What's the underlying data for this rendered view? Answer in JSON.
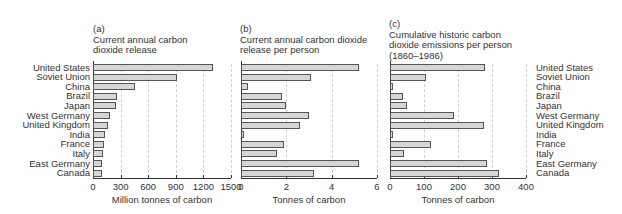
{
  "chart_data": [
    {
      "type": "bar",
      "orientation": "horizontal",
      "panel": "(a)",
      "title": "Current annual carbon dioxide release",
      "categories": [
        "United States",
        "Soviet Union",
        "China",
        "Brazil",
        "Japan",
        "West Germany",
        "United Kingdom",
        "India",
        "France",
        "Italy",
        "East Germany",
        "Canada"
      ],
      "values": [
        1300,
        915,
        460,
        260,
        255,
        190,
        165,
        130,
        120,
        110,
        95,
        100
      ],
      "xlabel": "Million tonnes of carbon",
      "xlim": [
        0,
        1500
      ],
      "ticks": [
        "0",
        "300",
        "600",
        "900",
        "1200",
        "1500"
      ],
      "grid": true
    },
    {
      "type": "bar",
      "orientation": "horizontal",
      "panel": "(b)",
      "title": "Current annual carbon dioxide release per person",
      "categories": [
        "United States",
        "Soviet Union",
        "China",
        "Brazil",
        "Japan",
        "West Germany",
        "United Kingdom",
        "India",
        "France",
        "Italy",
        "East Germany",
        "Canada"
      ],
      "values": [
        5.2,
        3.1,
        0.3,
        1.8,
        2.0,
        3.0,
        2.6,
        0.1,
        1.9,
        1.6,
        5.2,
        3.2
      ],
      "xlabel": "Tonnes of carbon",
      "xlim": [
        0,
        6
      ],
      "ticks": [
        "0",
        "2",
        "4",
        "6"
      ],
      "grid": true
    },
    {
      "type": "bar",
      "orientation": "horizontal",
      "panel": "(c)",
      "title": "Cumulative historic carbon dioxide emissions per person (1860–1986)",
      "categories": [
        "United States",
        "Soviet Union",
        "China",
        "Brazil",
        "Japan",
        "West Germany",
        "United Kingdom",
        "India",
        "France",
        "Italy",
        "East Germany",
        "Canada"
      ],
      "values": [
        280,
        105,
        6,
        38,
        50,
        187,
        275,
        7,
        120,
        40,
        285,
        320
      ],
      "xlabel": "Tonnes of carbon",
      "xlim": [
        0,
        400
      ],
      "ticks": [
        "0",
        "100",
        "200",
        "300",
        "400"
      ],
      "grid": true
    }
  ],
  "panels": {
    "a": {
      "letter": "(a)",
      "title1": "Current annual carbon",
      "title2": "dioxide release",
      "xlabel": "Million tonnes of carbon"
    },
    "b": {
      "letter": "(b)",
      "title1": "Current annual carbon dioxide",
      "title2": "release per person",
      "xlabel": "Tonnes of carbon"
    },
    "c": {
      "letter": "(c)",
      "title1": "Cumulative historic carbon",
      "title2": "dioxide emissions per person",
      "title3": "(1860–1986)",
      "xlabel": "Tonnes of carbon"
    }
  },
  "countries": [
    "United States",
    "Soviet Union",
    "China",
    "Brazil",
    "Japan",
    "West Germany",
    "United Kingdom",
    "India",
    "France",
    "Italy",
    "East Germany",
    "Canada"
  ]
}
